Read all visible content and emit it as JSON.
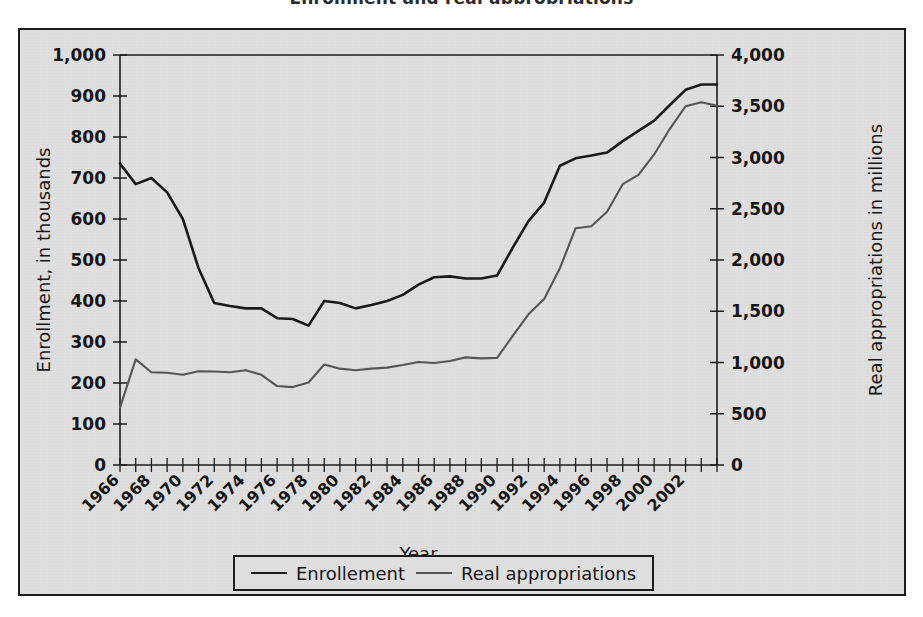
{
  "figure": {
    "title_remnant": "Enrollment and real appropriations",
    "background_color": "#dedede",
    "border_color": "#1c1c1c"
  },
  "legend": {
    "position": "bottom-center",
    "entries": [
      {
        "label": "Enrollement",
        "color": "#1a1a1a",
        "key": "enrollment"
      },
      {
        "label": "Real appropriations",
        "color": "#555555",
        "key": "appropriations"
      }
    ]
  },
  "chart_data": {
    "type": "line",
    "title": "",
    "xlabel": "Year",
    "ylabel": "Enrollment, in thousands",
    "y2label": "Real appropriations in millions",
    "grid": false,
    "legend_position": "bottom",
    "xlim": [
      1966,
      2004
    ],
    "ylim": [
      0,
      1000
    ],
    "y2lim": [
      0,
      4000
    ],
    "ytick_labels": [
      "1,000",
      "900",
      "800",
      "700",
      "600",
      "500",
      "400",
      "300",
      "200",
      "100",
      "0"
    ],
    "ytick_values": [
      1000,
      900,
      800,
      700,
      600,
      500,
      400,
      300,
      200,
      100,
      0
    ],
    "y2tick_labels": [
      "4,000",
      "3,500",
      "3,000",
      "2,500",
      "2,000",
      "1,500",
      "1,000",
      "500",
      "0"
    ],
    "y2tick_values": [
      4000,
      3500,
      3000,
      2500,
      2000,
      1500,
      1000,
      500,
      0
    ],
    "xtick_labels": [
      "1966",
      "1968",
      "1970",
      "1972",
      "1974",
      "1976",
      "1978",
      "1980",
      "1982",
      "1984",
      "1986",
      "1988",
      "1990",
      "1992",
      "1994",
      "1996",
      "1998",
      "2000",
      "2002"
    ],
    "xtick_values": [
      1966,
      1968,
      1970,
      1972,
      1974,
      1976,
      1978,
      1980,
      1982,
      1984,
      1986,
      1988,
      1990,
      1992,
      1994,
      1996,
      1998,
      2000,
      2002
    ],
    "x": [
      1966,
      1967,
      1968,
      1969,
      1970,
      1971,
      1972,
      1973,
      1974,
      1975,
      1976,
      1977,
      1978,
      1979,
      1980,
      1981,
      1982,
      1983,
      1984,
      1985,
      1986,
      1987,
      1988,
      1989,
      1990,
      1991,
      1992,
      1993,
      1994,
      1995,
      1996,
      1997,
      1998,
      1999,
      2000,
      2001,
      2002,
      2003,
      2004
    ],
    "series": [
      {
        "name": "Enrollement",
        "axis": "left",
        "units": "thousands",
        "color": "#1a1a1a",
        "values": [
          735,
          685,
          700,
          665,
          600,
          480,
          395,
          388,
          382,
          382,
          358,
          356,
          340,
          400,
          395,
          382,
          390,
          400,
          415,
          440,
          458,
          460,
          455,
          455,
          462,
          530,
          595,
          640,
          730,
          748,
          755,
          762,
          790,
          815,
          840,
          878,
          915,
          928,
          928
        ]
      },
      {
        "name": "Real appropriations",
        "axis": "right",
        "units": "millions",
        "color": "#555555",
        "values": [
          560,
          1030,
          905,
          900,
          880,
          915,
          912,
          905,
          925,
          880,
          770,
          760,
          805,
          980,
          940,
          925,
          940,
          950,
          975,
          1005,
          995,
          1015,
          1050,
          1040,
          1045,
          1260,
          1470,
          1620,
          1920,
          2310,
          2330,
          2470,
          2740,
          2830,
          3030,
          3280,
          3500,
          3540,
          3505
        ]
      }
    ]
  }
}
